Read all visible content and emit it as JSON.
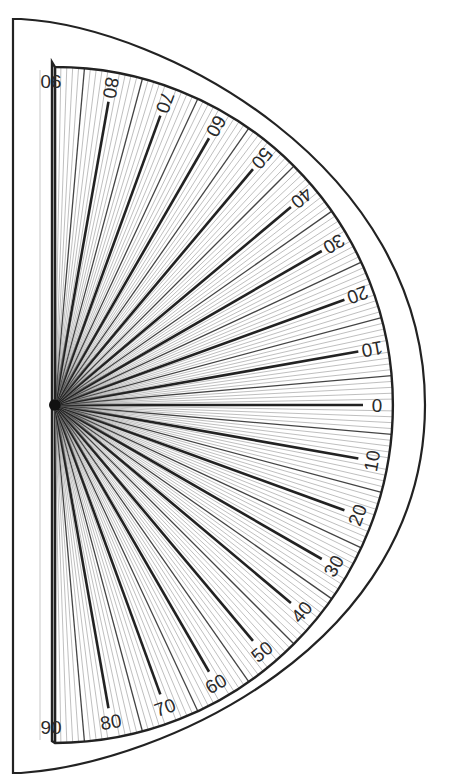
{
  "diagram": {
    "canvas": {
      "width": 449,
      "height": 784
    },
    "center": {
      "x": 55,
      "y": 405
    },
    "inner_radius": 338,
    "outer_shape": {
      "left_x": 13,
      "top_y": 19,
      "bottom_y": 773,
      "right_x": 425
    },
    "inner_shape": {
      "left_x": 52,
      "top_y": 62,
      "bottom_y": 741
    },
    "guide_line_x": 40,
    "colors": {
      "stroke": "#222222",
      "fine_line": "#8a8a8a",
      "guide": "#c8c8c8",
      "background": "#ffffff"
    },
    "tick_step_degrees": 1,
    "major_step_degrees": 10,
    "upper_labels": [
      "90",
      "80",
      "70",
      "60",
      "50",
      "40",
      "30",
      "20",
      "10",
      "0"
    ],
    "lower_labels": [
      "10",
      "20",
      "30",
      "40",
      "50",
      "60",
      "70",
      "80",
      "90"
    ],
    "upper_label_angles": [
      90,
      80,
      70,
      60,
      50,
      40,
      30,
      20,
      10,
      0
    ],
    "lower_label_angles": [
      -10,
      -20,
      -30,
      -40,
      -50,
      -60,
      -70,
      -80,
      -90
    ]
  }
}
